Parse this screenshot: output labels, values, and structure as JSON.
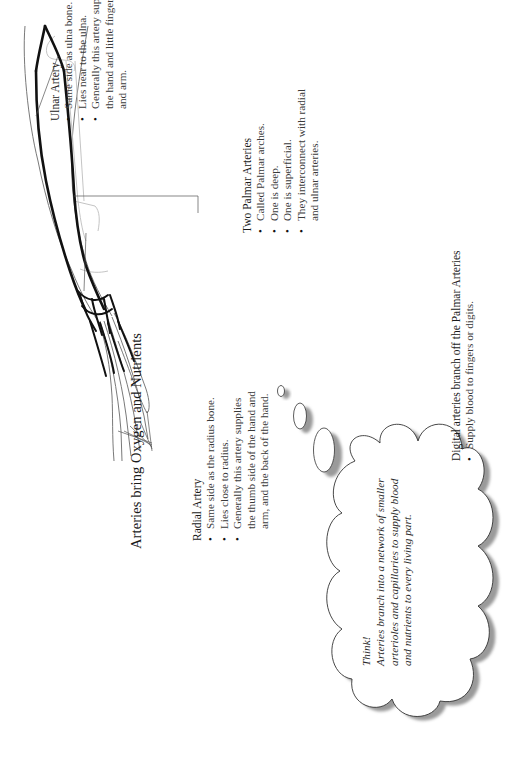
{
  "page": {
    "title": "Arteries bring Oxygen and Nutrients"
  },
  "radial_artery": {
    "heading": "Radial Artery",
    "bullets": [
      "Same side as the radius bone.",
      "Lies close to radius.",
      "Generally this artery supplies the thumb side of the hand and arm, and the back of the hand."
    ]
  },
  "ulnar_artery": {
    "heading": "Ulnar Artery",
    "bullets": [
      "Same side as ulna bone.",
      "Lies near to the ulna.",
      "Generally this artery supplies the palm of the hand and little finger side of the hand and arm."
    ]
  },
  "palmar_arteries": {
    "heading": "Two Palmar Arteries",
    "bullets": [
      "Called Palmar arches.",
      "One is deep.",
      "One is superficial.",
      "They interconnect with radial and ulnar arteries."
    ]
  },
  "digital_arteries": {
    "heading": "Digital arteries branch off the Palmar Arteries",
    "bullets": [
      "Supply blood to fingers or digits."
    ]
  },
  "think_bubble": {
    "label": "Think!",
    "text": "Arteries branch into a network of smaller arterioles and capillaries to supply blood and nutrients to every living part."
  },
  "illustration": {
    "icon": "arm-arteries-diagram",
    "artery_color": "#111111",
    "outline_color": "#555555",
    "bone_color": "#b8b8b8",
    "shadow_color": "#9a9a9a"
  }
}
